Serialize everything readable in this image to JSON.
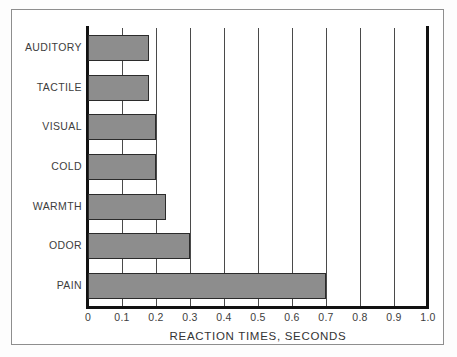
{
  "figure": {
    "frame_color": "#8e8e8e",
    "background": "#ffffff"
  },
  "chart_data": {
    "type": "bar",
    "orientation": "horizontal",
    "title": "",
    "subtitle": "",
    "xlabel": "REACTION TIMES, SECONDS",
    "ylabel": "",
    "categories": [
      "AUDITORY",
      "TACTILE",
      "VISUAL",
      "COLD",
      "WARMTH",
      "ODOR",
      "PAIN"
    ],
    "values": [
      0.18,
      0.18,
      0.2,
      0.2,
      0.23,
      0.3,
      0.7
    ],
    "series": [
      {
        "name": "Reaction time",
        "values": [
          0.18,
          0.18,
          0.2,
          0.2,
          0.23,
          0.3,
          0.7
        ]
      }
    ],
    "xlim": [
      0,
      1.0
    ],
    "xticks": [
      0,
      0.1,
      0.2,
      0.3,
      0.4,
      0.5,
      0.6,
      0.7,
      0.8,
      0.9,
      1.0
    ],
    "xtick_labels": [
      "0",
      "0.1",
      "0.2",
      "0.3",
      "0.4",
      "0.5",
      "0.6",
      "0.7",
      "0.8",
      "0.9",
      "1.0"
    ],
    "grid": "vertical",
    "legend": "none",
    "bar_fill_color": "#8d8d8d",
    "bar_edge_color": "#2b2b2b",
    "gridline_color": "#4a4a4a",
    "axis_color": "#111111"
  }
}
